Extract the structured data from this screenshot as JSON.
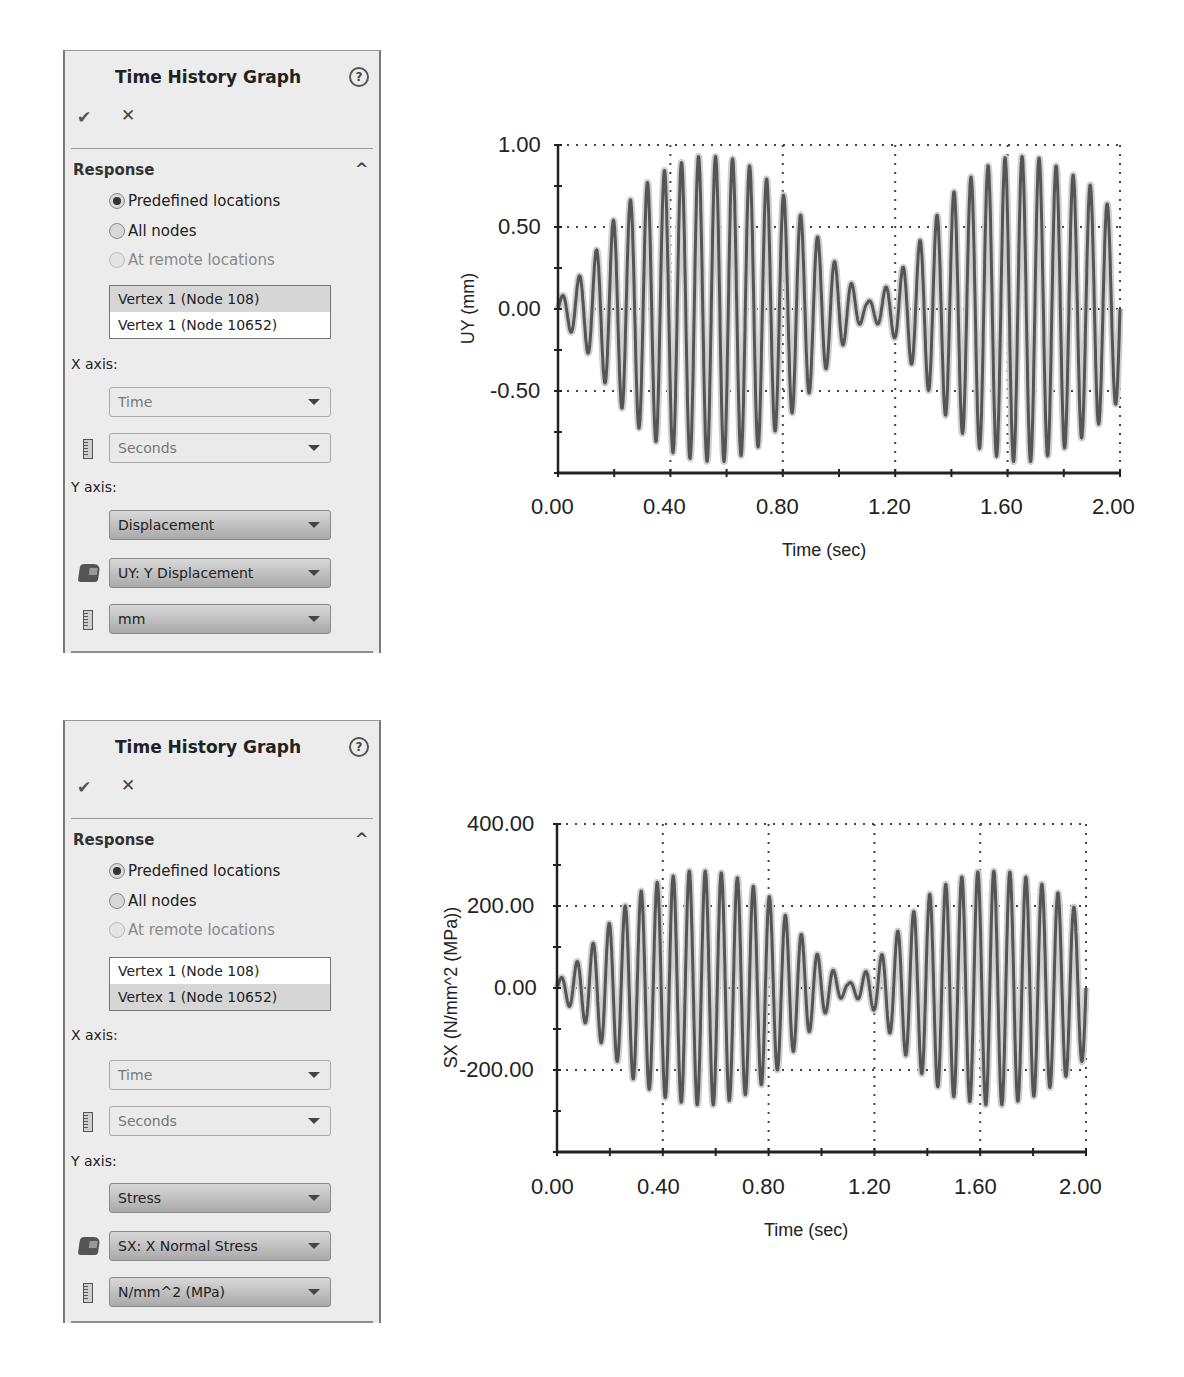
{
  "panels": [
    {
      "title": "Time History Graph",
      "help_icon": "?",
      "ok_icon": "✔",
      "cancel_icon": "✕",
      "section": "Response",
      "collapse_icon": "^",
      "radios": [
        {
          "label": "Predefined locations",
          "checked": true,
          "disabled": false
        },
        {
          "label": "All nodes",
          "checked": false,
          "disabled": false
        },
        {
          "label": "At remote locations",
          "checked": false,
          "disabled": true
        }
      ],
      "list_items": [
        {
          "label": "Vertex 1 (Node 108)",
          "selected": true
        },
        {
          "label": "Vertex 1 (Node 10652)",
          "selected": false
        }
      ],
      "x_axis_label": "X axis:",
      "x_quantity": "Time",
      "x_unit": "Seconds",
      "y_axis_label": "Y axis:",
      "y_quantity": "Displacement",
      "y_component": "UY: Y Displacement",
      "y_unit": "mm"
    },
    {
      "title": "Time History Graph",
      "help_icon": "?",
      "ok_icon": "✔",
      "cancel_icon": "✕",
      "section": "Response",
      "collapse_icon": "^",
      "radios": [
        {
          "label": "Predefined locations",
          "checked": true,
          "disabled": false
        },
        {
          "label": "All nodes",
          "checked": false,
          "disabled": false
        },
        {
          "label": "At remote locations",
          "checked": false,
          "disabled": true
        }
      ],
      "list_items": [
        {
          "label": "Vertex 1 (Node 108)",
          "selected": false
        },
        {
          "label": "Vertex 1 (Node 10652)",
          "selected": true
        }
      ],
      "x_axis_label": "X axis:",
      "x_quantity": "Time",
      "x_unit": "Seconds",
      "y_axis_label": "Y axis:",
      "y_quantity": "Stress",
      "y_component": "SX: X Normal Stress",
      "y_unit": "N/mm^2 (MPa)"
    }
  ],
  "chart_data": [
    {
      "type": "line",
      "title": "",
      "xlabel": "Time (sec)",
      "ylabel": "UY (mm)",
      "xlim": [
        0,
        2.0
      ],
      "ylim": [
        -1.0,
        1.0
      ],
      "x_ticks": [
        "0.00",
        "0.40",
        "0.80",
        "1.20",
        "1.60",
        "2.00"
      ],
      "y_ticks": [
        "1.00",
        "0.50",
        "0.00",
        "-0.50"
      ],
      "grid": true,
      "line_color": "#555555",
      "carrier_hz": 16.5,
      "series": [
        {
          "name": "UY",
          "note": "beating oscillation; per-cycle peak envelope sampled at t",
          "envelope_t": [
            0.0,
            0.1,
            0.2,
            0.3,
            0.4,
            0.5,
            0.6,
            0.7,
            0.8,
            0.9,
            1.0,
            1.1,
            1.2,
            1.3,
            1.4,
            1.5,
            1.6,
            1.7,
            1.8,
            1.9,
            2.0
          ],
          "envelope_amp": [
            0.05,
            0.25,
            0.55,
            0.75,
            0.87,
            0.93,
            0.93,
            0.86,
            0.7,
            0.5,
            0.25,
            0.04,
            0.18,
            0.45,
            0.7,
            0.85,
            0.93,
            0.93,
            0.85,
            0.75,
            0.55
          ]
        }
      ]
    },
    {
      "type": "line",
      "title": "",
      "xlabel": "Time (sec)",
      "ylabel": "SX (N/mm^2 (MPa))",
      "xlim": [
        0,
        2.0
      ],
      "ylim": [
        -400,
        400
      ],
      "x_ticks": [
        "0.00",
        "0.40",
        "0.80",
        "1.20",
        "1.60",
        "2.00"
      ],
      "y_ticks": [
        "400.00",
        "200.00",
        "0.00",
        "-200.00"
      ],
      "grid": true,
      "line_color": "#555555",
      "carrier_hz": 16.5,
      "series": [
        {
          "name": "SX",
          "note": "beating oscillation; per-cycle peak envelope sampled at t",
          "envelope_t": [
            0.0,
            0.1,
            0.2,
            0.3,
            0.4,
            0.5,
            0.6,
            0.7,
            0.8,
            0.9,
            1.0,
            1.1,
            1.2,
            1.3,
            1.4,
            1.5,
            1.6,
            1.7,
            1.8,
            1.9,
            2.0
          ],
          "envelope_amp": [
            15,
            80,
            160,
            230,
            265,
            285,
            285,
            265,
            225,
            150,
            70,
            10,
            55,
            150,
            225,
            265,
            285,
            285,
            265,
            230,
            170
          ]
        }
      ]
    }
  ]
}
